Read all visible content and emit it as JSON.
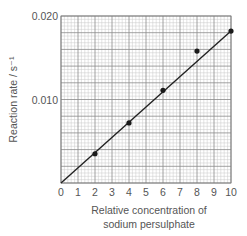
{
  "chart_data": {
    "type": "scatter",
    "title": "",
    "xlabel": "Relative concentration of sodium persulphate",
    "xlabel_lines": [
      "Relative concentration of",
      "sodium persulphate"
    ],
    "ylabel": "Reaction rate / s⁻¹",
    "xlim": [
      0,
      10
    ],
    "ylim": [
      0,
      0.02
    ],
    "x_ticks": [
      "0",
      "1",
      "2",
      "3",
      "4",
      "5",
      "6",
      "7",
      "8",
      "9",
      "10"
    ],
    "y_ticks": [
      "0.010",
      "0.020"
    ],
    "y_tick_values": [
      0.01,
      0.02
    ],
    "grid": true,
    "grid_style": "graph paper: major lines every 1 unit (x) and 0.002 (y), 5 minor subdivisions each",
    "series": [
      {
        "name": "Measured reaction rate",
        "marker": "dot",
        "x": [
          2,
          4,
          6,
          8,
          10
        ],
        "y": [
          0.0035,
          0.0072,
          0.0111,
          0.0158,
          0.0182
        ]
      }
    ],
    "best_fit_line": {
      "name": "Line of best fit",
      "from": [
        0,
        0
      ],
      "to": [
        10,
        0.0182
      ]
    },
    "legend": null
  }
}
